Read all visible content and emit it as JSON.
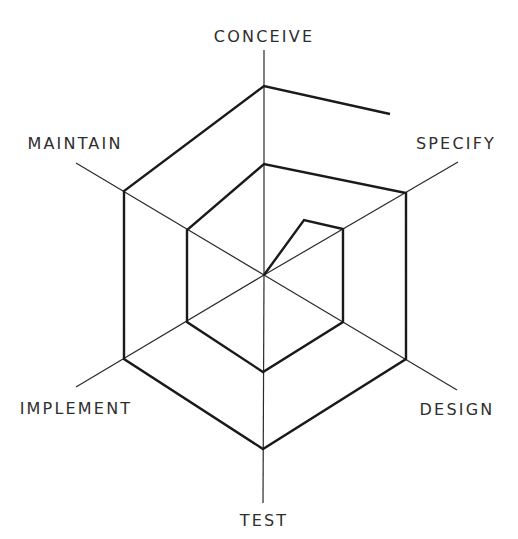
{
  "diagram": {
    "title": "",
    "type": "spiral-hexagon-lifecycle",
    "center": [
      264,
      275
    ],
    "axes": [
      {
        "id": "conceive",
        "label": "CONCEIVE",
        "end": [
          264,
          50
        ],
        "label_pos": [
          264,
          42
        ],
        "anchor": "middle"
      },
      {
        "id": "specify",
        "label": "SPECIFY",
        "end": [
          458,
          162
        ],
        "label_pos": [
          456,
          149
        ],
        "anchor": "middle"
      },
      {
        "id": "design",
        "label": "DESIGN",
        "end": [
          457,
          390
        ],
        "label_pos": [
          457,
          415
        ],
        "anchor": "middle"
      },
      {
        "id": "test",
        "label": "TEST",
        "end": [
          263,
          503
        ],
        "label_pos": [
          264,
          526
        ],
        "anchor": "middle"
      },
      {
        "id": "implement",
        "label": "IMPLEMENT",
        "end": [
          76,
          387
        ],
        "label_pos": [
          76,
          414
        ],
        "anchor": "middle"
      },
      {
        "id": "maintain",
        "label": "MAINTAIN",
        "end": [
          76,
          163
        ],
        "label_pos": [
          75,
          149
        ],
        "anchor": "middle"
      }
    ],
    "spiral_points": [
      [
        264,
        275
      ],
      [
        304,
        220
      ],
      [
        343,
        229
      ],
      [
        343,
        322
      ],
      [
        263,
        372
      ],
      [
        187,
        322
      ],
      [
        187,
        230
      ],
      [
        264,
        164
      ],
      [
        406,
        193
      ],
      [
        406,
        359
      ],
      [
        263,
        449
      ],
      [
        124,
        359
      ],
      [
        124,
        191
      ],
      [
        264,
        86
      ],
      [
        390,
        114
      ]
    ],
    "colors": {
      "line": "#1a1a1a",
      "axis": "#2a2a2a",
      "text": "#2e2e2e",
      "background": "#ffffff"
    }
  }
}
